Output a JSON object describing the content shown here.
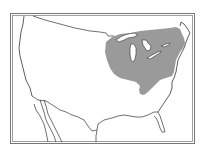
{
  "map": {
    "type": "species-range-map",
    "region": "Contiguous United States",
    "range_description": "Northeastern / Great Lakes / Ohio Valley region",
    "colors": {
      "background": "#ffffff",
      "land": "#ffffff",
      "outline": "#333333",
      "range_fill": "#9a9a9a",
      "frame": "#666666"
    }
  }
}
